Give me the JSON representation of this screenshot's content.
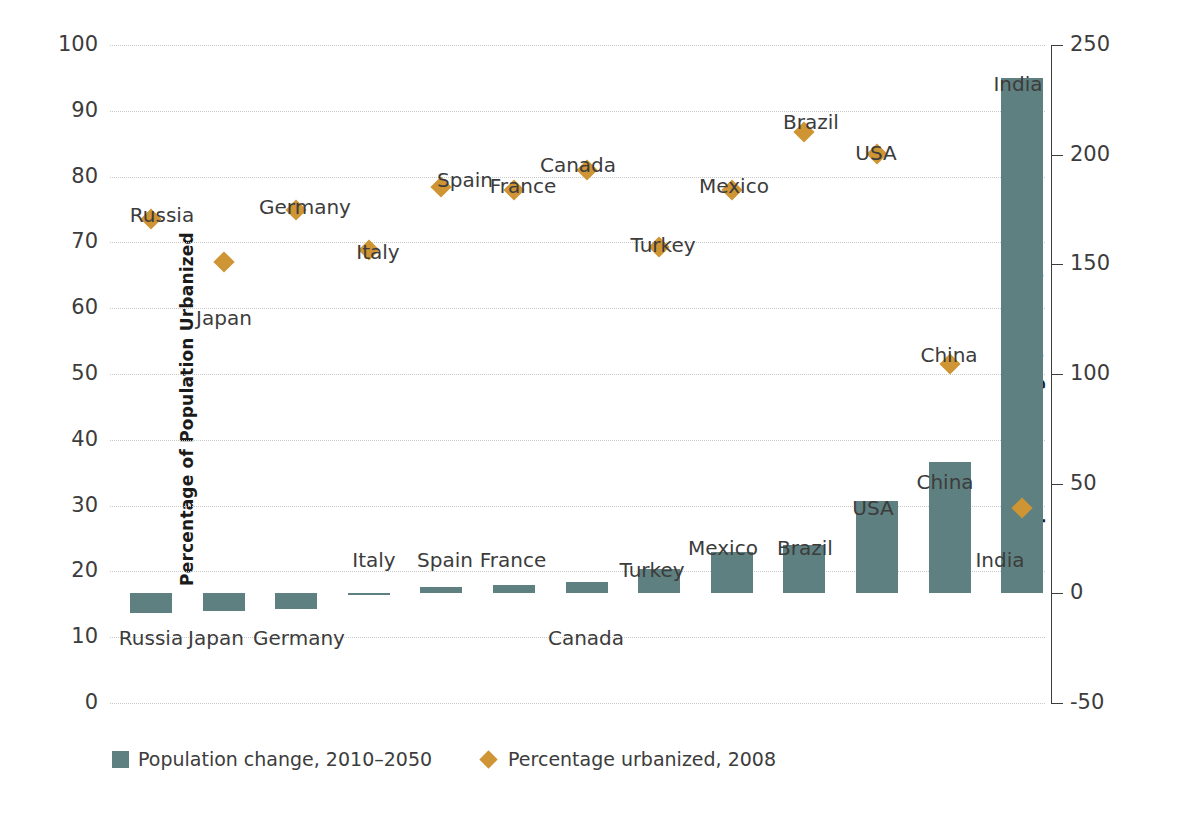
{
  "chart_data": {
    "type": "bar",
    "title": "",
    "categories": [
      "Russia",
      "Japan",
      "Germany",
      "Italy",
      "Spain",
      "France",
      "Canada",
      "Turkey",
      "Mexico",
      "Brazil",
      "USA",
      "China",
      "India"
    ],
    "series": [
      {
        "name": "Population change, 2010–2050",
        "axis": "right",
        "unit": "millions",
        "marker": "bar",
        "color": "#5f8080",
        "values": [
          -9,
          -8,
          -7,
          -0.5,
          3,
          4,
          5,
          11,
          19,
          22,
          42,
          60,
          235
        ]
      },
      {
        "name": "Percentage urbanized, 2008",
        "axis": "left",
        "unit": "percent",
        "marker": "diamond",
        "color": "#cf9433",
        "values": [
          73.5,
          67,
          75,
          68.8,
          78.4,
          78,
          81,
          69.3,
          78,
          86.8,
          83.4,
          51.5,
          29.6
        ]
      }
    ],
    "ylabel": "Percentage of Population Urbanized",
    "ylim": [
      0,
      100
    ],
    "yticks": [
      100,
      90,
      80,
      70,
      60,
      50,
      40,
      30,
      20,
      10,
      0
    ],
    "y2label": "Population Change (millions)",
    "y2lim": [
      -50,
      250
    ],
    "y2ticks": [
      250,
      200,
      150,
      100,
      50,
      0,
      -50
    ],
    "xlabel": "",
    "grid": true,
    "legend_position": "bottom-left",
    "bar_labels": [
      {
        "country": "Russia",
        "text": "Russia",
        "x": 151,
        "y": 628
      },
      {
        "country": "Japan",
        "text": "Japan",
        "x": 216,
        "y": 628
      },
      {
        "country": "Germany",
        "text": "Germany",
        "x": 299,
        "y": 628
      },
      {
        "country": "Italy",
        "text": "Italy",
        "x": 374,
        "y": 550
      },
      {
        "country": "Spain",
        "text": "Spain",
        "x": 445,
        "y": 550
      },
      {
        "country": "France",
        "text": "France",
        "x": 513,
        "y": 550
      },
      {
        "country": "Canada",
        "text": "Canada",
        "x": 586,
        "y": 628
      },
      {
        "country": "Turkey",
        "text": "Turkey",
        "x": 652,
        "y": 560
      },
      {
        "country": "Mexico",
        "text": "Mexico",
        "x": 723,
        "y": 538
      },
      {
        "country": "Brazil",
        "text": "Brazil",
        "x": 805,
        "y": 538
      },
      {
        "country": "USA",
        "text": "USA",
        "x": 873,
        "y": 498
      },
      {
        "country": "China",
        "text": "China",
        "x": 945,
        "y": 472
      },
      {
        "country": "India",
        "text": "India",
        "x": 1018,
        "y": 74
      }
    ],
    "marker_labels": [
      {
        "country": "Russia",
        "text": "Russia",
        "x": 162,
        "y": 205
      },
      {
        "country": "Japan",
        "text": "Japan",
        "x": 224,
        "y": 308
      },
      {
        "country": "Germany",
        "text": "Germany",
        "x": 305,
        "y": 197
      },
      {
        "country": "Italy",
        "text": "Italy",
        "x": 378,
        "y": 242
      },
      {
        "country": "Spain",
        "text": "Spain",
        "x": 465,
        "y": 170
      },
      {
        "country": "France",
        "text": "France",
        "x": 523,
        "y": 176
      },
      {
        "country": "Canada",
        "text": "Canada",
        "x": 578,
        "y": 155
      },
      {
        "country": "Turkey",
        "text": "Turkey",
        "x": 663,
        "y": 235
      },
      {
        "country": "Mexico",
        "text": "Mexico",
        "x": 734,
        "y": 176
      },
      {
        "country": "Brazil",
        "text": "Brazil",
        "x": 811,
        "y": 112
      },
      {
        "country": "USA",
        "text": "USA",
        "x": 876,
        "y": 143
      },
      {
        "country": "China",
        "text": "China",
        "x": 949,
        "y": 345
      },
      {
        "country": "India",
        "text": "India",
        "x": 1000,
        "y": 550
      }
    ]
  },
  "axes": {
    "left": {
      "title": "Percentage of Population Urbanized",
      "ticks": [
        "100",
        "90",
        "80",
        "70",
        "60",
        "50",
        "40",
        "30",
        "20",
        "10",
        "0"
      ]
    },
    "right": {
      "title": "Population Change (millions)",
      "ticks": [
        "250",
        "200",
        "150",
        "100",
        "50",
        "0",
        "-50"
      ]
    }
  },
  "legend": {
    "items": [
      {
        "label": "Population change, 2010–2050",
        "swatch": "bar-swatch",
        "color": "#5f8080"
      },
      {
        "label": "Percentage urbanized, 2008",
        "swatch": "diamond-swatch",
        "color": "#cf9433"
      }
    ]
  }
}
